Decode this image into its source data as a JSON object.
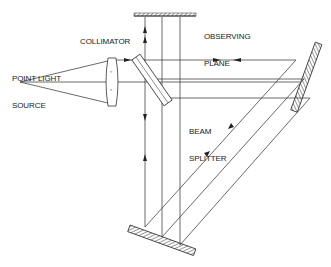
{
  "diagram": {
    "type": "optical-interferometer-schematic",
    "labels": {
      "point_source_line1": "POINT LIGHT",
      "point_source_line2": "SOURCE",
      "collimator": "COLLIMATOR",
      "observing_line1": "OBSERVING",
      "observing_line2": "PLANE",
      "splitter_line1": "BEAM",
      "splitter_line2": "SPLITTER"
    },
    "components": [
      {
        "name": "point-light-source"
      },
      {
        "name": "collimator-lens"
      },
      {
        "name": "beam-splitter"
      },
      {
        "name": "observing-plane"
      },
      {
        "name": "right-mirror"
      },
      {
        "name": "bottom-mirror"
      }
    ],
    "colors": {
      "line": "#333333",
      "background": "#ffffff"
    }
  }
}
